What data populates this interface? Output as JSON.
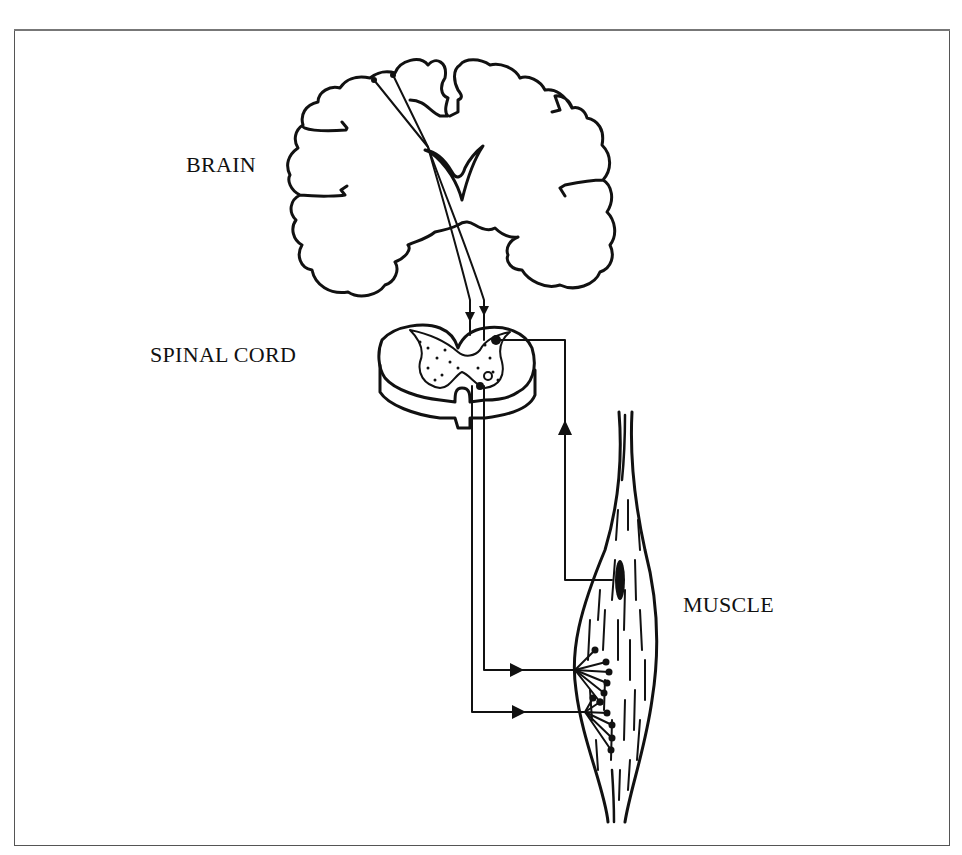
{
  "figure": {
    "labels": {
      "brain": "BRAIN",
      "spinal_cord": "SPINAL CORD",
      "muscle": "MUSCLE"
    },
    "components": [
      {
        "name": "brain",
        "type": "coronal-brain-section"
      },
      {
        "name": "spinal-cord",
        "type": "spinal-cord-cross-section"
      },
      {
        "name": "muscle",
        "type": "skeletal-muscle-with-spindle"
      }
    ],
    "pathways": [
      {
        "name": "descending-motor-pathway",
        "from": "brain",
        "to": "spinal-cord",
        "direction": "down"
      },
      {
        "name": "sensory-afferent",
        "from": "muscle",
        "to": "spinal-cord",
        "direction": "up"
      },
      {
        "name": "motor-efferent-1",
        "from": "spinal-cord",
        "to": "muscle",
        "direction": "right"
      },
      {
        "name": "motor-efferent-2",
        "from": "spinal-cord",
        "to": "muscle",
        "direction": "right"
      }
    ],
    "colors": {
      "ink": "#111111",
      "frame": "#555555",
      "background": "#ffffff"
    }
  }
}
